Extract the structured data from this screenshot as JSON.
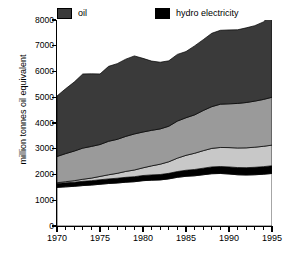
{
  "chart_data": {
    "type": "area",
    "title": "",
    "subtitle": "",
    "xlabel": "",
    "ylabel": "million tonnes oil equivalent",
    "xlim": [
      1970,
      1995
    ],
    "ylim": [
      0,
      8000
    ],
    "grid": false,
    "stacked": true,
    "legend_position": "top",
    "x": [
      1970,
      1971,
      1972,
      1973,
      1974,
      1975,
      1976,
      1977,
      1978,
      1979,
      1980,
      1981,
      1982,
      1983,
      1984,
      1985,
      1986,
      1987,
      1988,
      1989,
      1990,
      1991,
      1992,
      1993,
      1994,
      1995
    ],
    "series": [
      {
        "name": "coal",
        "color": "#ffffff",
        "order": 1,
        "values": [
          1500,
          1520,
          1540,
          1570,
          1590,
          1620,
          1650,
          1670,
          1700,
          1720,
          1760,
          1780,
          1790,
          1830,
          1890,
          1930,
          1950,
          1990,
          2030,
          2040,
          2020,
          1990,
          1980,
          1990,
          2010,
          2040
        ]
      },
      {
        "name": "hydro electricity",
        "color": "#000000",
        "order": 2,
        "values": [
          150,
          155,
          160,
          165,
          170,
          175,
          180,
          185,
          190,
          195,
          200,
          205,
          210,
          215,
          225,
          235,
          245,
          255,
          265,
          270,
          275,
          280,
          285,
          290,
          295,
          300
        ]
      },
      {
        "name": "nuclear energy",
        "color": "#c8c8c8",
        "order": 3,
        "values": [
          30,
          45,
          60,
          80,
          100,
          130,
          160,
          190,
          230,
          260,
          300,
          350,
          400,
          450,
          520,
          580,
          630,
          680,
          720,
          740,
          750,
          760,
          770,
          780,
          790,
          800
        ]
      },
      {
        "name": "natural gas",
        "color": "#9a9a9a",
        "order": 4,
        "values": [
          1020,
          1090,
          1150,
          1210,
          1230,
          1240,
          1300,
          1320,
          1360,
          1400,
          1390,
          1380,
          1370,
          1380,
          1440,
          1460,
          1490,
          1560,
          1620,
          1680,
          1700,
          1730,
          1760,
          1790,
          1820,
          1860
        ]
      },
      {
        "name": "oil",
        "color": "#3a3a3a",
        "order": 5,
        "values": [
          2350,
          2520,
          2680,
          2880,
          2820,
          2740,
          2910,
          2940,
          3000,
          3030,
          2860,
          2690,
          2590,
          2540,
          2590,
          2570,
          2680,
          2750,
          2850,
          2870,
          2870,
          2860,
          2900,
          2930,
          3010,
          3250
        ]
      }
    ],
    "totals": [
      5050,
      5330,
      5590,
      5905,
      5910,
      5905,
      6200,
      6305,
      6480,
      6605,
      6510,
      6405,
      6360,
      6415,
      6665,
      6775,
      6995,
      7235,
      7485,
      7600,
      7615,
      7620,
      7695,
      7780,
      7925,
      8250
    ],
    "yticks": [
      {
        "value": 0,
        "label": "0"
      },
      {
        "value": 1000,
        "label": "1000"
      },
      {
        "value": 2000,
        "label": "2000"
      },
      {
        "value": 3000,
        "label": "3000"
      },
      {
        "value": 4000,
        "label": "4000"
      },
      {
        "value": 5000,
        "label": "5000"
      },
      {
        "value": 6000,
        "label": "6000"
      },
      {
        "value": 7000,
        "label": "7000"
      },
      {
        "value": 8000,
        "label": "8000"
      }
    ],
    "xticks_major": [
      {
        "value": 1970,
        "label": "1970"
      },
      {
        "value": 1975,
        "label": "1975"
      },
      {
        "value": 1980,
        "label": "1980"
      },
      {
        "value": 1985,
        "label": "1985"
      },
      {
        "value": 1990,
        "label": "1990"
      },
      {
        "value": 1995,
        "label": "1995"
      }
    ],
    "xticks_minor": [
      1971,
      1972,
      1973,
      1974,
      1976,
      1977,
      1978,
      1979,
      1981,
      1982,
      1983,
      1984,
      1986,
      1987,
      1988,
      1989,
      1991,
      1992,
      1993,
      1994
    ]
  },
  "legend": {
    "left_column": [
      {
        "label": "oil",
        "color": "#3a3a3a"
      },
      {
        "label": "natural gas",
        "color": "#9a9a9a"
      },
      {
        "label": "nuclear energy",
        "color": "#c8c8c8"
      }
    ],
    "right_column": [
      {
        "label": "hydro electricity",
        "color": "#000000"
      },
      {
        "label": "coal",
        "color": "#ffffff"
      }
    ]
  },
  "axis": {
    "y_title": "million tonnes oil equivalent"
  }
}
